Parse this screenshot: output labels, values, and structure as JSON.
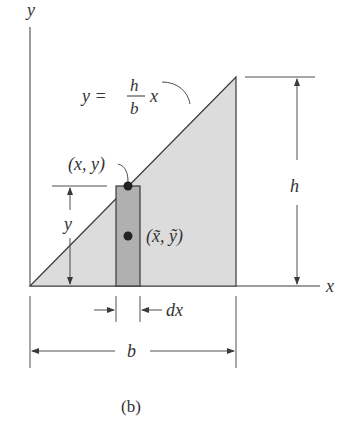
{
  "figure": {
    "caption": "(b)",
    "colors": {
      "line": "#3a3a3a",
      "triangle_fill": "#dcdcdc",
      "strip_fill": "#b0b0b0",
      "dot": "#222222",
      "text": "#333333"
    }
  },
  "axes": {
    "x_label": "x",
    "y_label": "y"
  },
  "curve": {
    "label_lhs": "y =",
    "frac_num": "h",
    "frac_den": "b",
    "label_var": "x"
  },
  "strip": {
    "top_point_label": "(x, y)",
    "centroid_label": "(x̃, ỹ)",
    "height_label": "y",
    "width_label": "dx"
  },
  "dimensions": {
    "height_label": "h",
    "base_label": "b"
  }
}
